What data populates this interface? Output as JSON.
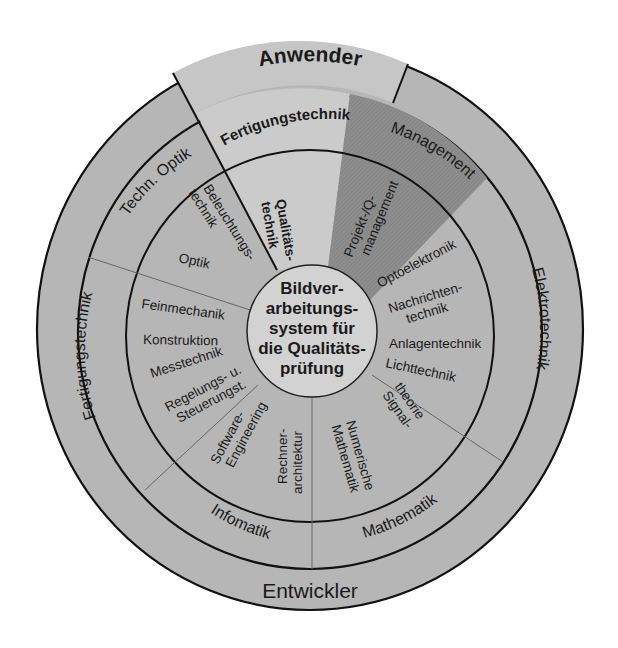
{
  "diagram": {
    "title_center": [
      "Bildver-",
      "arbeitungs-",
      "system für",
      "die Qualitäts-",
      "prüfung"
    ],
    "outer_ring": {
      "top": "Anwender",
      "bottom": "Entwickler"
    },
    "middle_ring": {
      "fertigungstechnik_top": "Fertigungstechnik",
      "management": "Management",
      "elektrotechnik": "Elektrotechnik",
      "mathematik": "Mathematik",
      "informatik": "Infomatik",
      "fertigungstechnik_left": "Fertigungstechnik",
      "techn_optik": "Techn. Optik"
    },
    "inner_ring": {
      "qualitaetstechnik": [
        "Qualitäts-",
        "technik"
      ],
      "projekt_q_management": [
        "Projekt-/Q-",
        "management"
      ],
      "optoelektronik": "Optoelektronik",
      "nachrichtentechnik": [
        "Nachrichten-",
        "technik"
      ],
      "anlagentechnik": "Anlagentechnik",
      "lichttechnik": "Lichttechnik",
      "signaltheorie": [
        "Signal-",
        "theorie"
      ],
      "numerische_mathematik": [
        "Numerische",
        "Mathematik"
      ],
      "rechnerarchitektur": [
        "Rechner-",
        "architektur"
      ],
      "software_engineering": [
        "Software-",
        "Engineering"
      ],
      "regelungs_steuerungst": [
        "Regelungs- u.",
        "Steuerungst."
      ],
      "messtechnik": "Messtechnik",
      "konstruktion": "Konstruktion",
      "feinmechanik": "Feinmechanik",
      "optik": "Optik",
      "beleuchtungstechnik": [
        "Beleuchtungs-",
        "technik"
      ]
    },
    "colors": {
      "base_gray": "#b6b6b6",
      "light_wedge": "#cbcbcb",
      "anwender_band": "#c6c6c6",
      "management_wedge": "#8c8c8c",
      "center_circle": "#d2d2d2",
      "line": "#111111"
    }
  }
}
